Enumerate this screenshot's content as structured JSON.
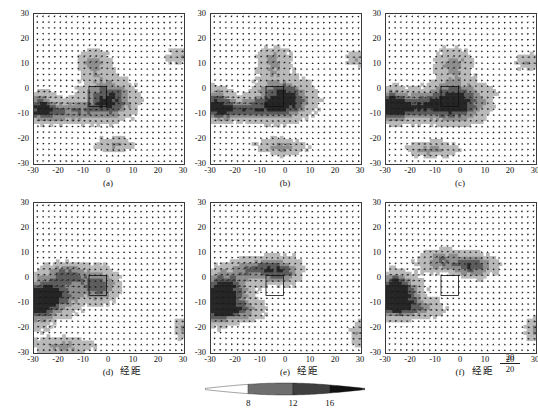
{
  "figure": {
    "width": 538,
    "height": 409,
    "background": "#ffffff",
    "rows": 2,
    "cols": 3
  },
  "axis": {
    "x_label": "经距",
    "y_label": "纬距",
    "x_ticks": [
      "-30",
      "-20",
      "-10",
      "0",
      "10",
      "20",
      "30"
    ],
    "y_ticks": [
      "30",
      "20",
      "10",
      "0",
      "-10",
      "-20",
      "-30"
    ],
    "x_tick_values": [
      -30,
      -20,
      -10,
      0,
      10,
      20,
      30
    ],
    "y_tick_values": [
      30,
      20,
      10,
      0,
      -10,
      -20,
      -30
    ],
    "xlim": [
      -30,
      30
    ],
    "ylim": [
      -30,
      30
    ]
  },
  "panels": [
    {
      "id": "a",
      "label": "(a)",
      "row": 0,
      "col": 0,
      "show_ylabel": true,
      "show_xlabel": false,
      "show_quiverkey": false
    },
    {
      "id": "b",
      "label": "(b)",
      "row": 0,
      "col": 1,
      "show_ylabel": false,
      "show_xlabel": false,
      "show_quiverkey": false
    },
    {
      "id": "c",
      "label": "(c)",
      "row": 0,
      "col": 2,
      "show_ylabel": false,
      "show_xlabel": false,
      "show_quiverkey": false
    },
    {
      "id": "d",
      "label": "(d)",
      "row": 1,
      "col": 0,
      "show_ylabel": true,
      "show_xlabel": true,
      "show_quiverkey": false
    },
    {
      "id": "e",
      "label": "(e)",
      "row": 1,
      "col": 1,
      "show_ylabel": false,
      "show_xlabel": true,
      "show_quiverkey": false
    },
    {
      "id": "f",
      "label": "(f)",
      "row": 1,
      "col": 2,
      "show_ylabel": false,
      "show_xlabel": true,
      "show_quiverkey": true
    }
  ],
  "quiver_key": {
    "value_top": "20",
    "value_bottom": "20",
    "x_position": 20
  },
  "colorbar": {
    "tick_labels": [
      "8",
      "12",
      "16"
    ],
    "tick_values": [
      8,
      12,
      16
    ],
    "shape": "pointed-lens",
    "segments": [
      {
        "from": 0.0,
        "to": 0.27,
        "color": "#ffffff"
      },
      {
        "from": 0.27,
        "to": 0.55,
        "color": "#6e6e6e"
      },
      {
        "from": 0.55,
        "to": 0.78,
        "color": "#3f3f3f"
      },
      {
        "from": 0.78,
        "to": 1.0,
        "color": "#111111"
      }
    ]
  },
  "chart_data": {
    "type": "quiver",
    "title": "",
    "xlabel": "经距",
    "ylabel": "纬距",
    "xlim": [
      -30,
      30
    ],
    "ylim": [
      -30,
      30
    ],
    "grid": false,
    "legend": "colorbar-bottom",
    "colorbar_label": "",
    "colorbar_ticks": [
      8,
      12,
      16
    ],
    "colorbar_range": [
      4,
      20
    ],
    "units_note": "wind speed shading 8/12/16; vector key 20",
    "panel_ids": [
      "a",
      "b",
      "c",
      "d",
      "e",
      "f"
    ],
    "series": [
      {
        "name": "a",
        "shaded_features": [
          {
            "kind": "core",
            "x": 0,
            "y": -4,
            "rx": 9,
            "ry": 7,
            "speed": 17
          },
          {
            "kind": "band",
            "x": -20,
            "y": -9,
            "rx": 13,
            "ry": 4,
            "speed": 14
          },
          {
            "kind": "tail",
            "x": -28,
            "y": -6,
            "rx": 5,
            "ry": 5,
            "speed": 13
          },
          {
            "kind": "plume",
            "x": -6,
            "y": 10,
            "rx": 6,
            "ry": 6,
            "speed": 12
          },
          {
            "kind": "patch",
            "x": 2,
            "y": -22,
            "rx": 7,
            "ry": 3,
            "speed": 11
          },
          {
            "kind": "edge",
            "x": 28,
            "y": 13,
            "rx": 5,
            "ry": 3,
            "speed": 11
          }
        ]
      },
      {
        "name": "b",
        "shaded_features": [
          {
            "kind": "core",
            "x": -1,
            "y": -4,
            "rx": 10,
            "ry": 7,
            "speed": 18
          },
          {
            "kind": "band",
            "x": -20,
            "y": -8,
            "rx": 14,
            "ry": 4,
            "speed": 15
          },
          {
            "kind": "tail",
            "x": -28,
            "y": -5,
            "rx": 5,
            "ry": 6,
            "speed": 13
          },
          {
            "kind": "plume",
            "x": -5,
            "y": 11,
            "rx": 6,
            "ry": 6,
            "speed": 12
          },
          {
            "kind": "patch",
            "x": -2,
            "y": -23,
            "rx": 9,
            "ry": 3,
            "speed": 12
          },
          {
            "kind": "edge",
            "x": 28,
            "y": 12,
            "rx": 4,
            "ry": 3,
            "speed": 11
          }
        ]
      },
      {
        "name": "c",
        "shaded_features": [
          {
            "kind": "core",
            "x": -2,
            "y": -5,
            "rx": 11,
            "ry": 7,
            "speed": 18
          },
          {
            "kind": "band",
            "x": -21,
            "y": -7,
            "rx": 13,
            "ry": 5,
            "speed": 15
          },
          {
            "kind": "tail",
            "x": -28,
            "y": -6,
            "rx": 5,
            "ry": 6,
            "speed": 14
          },
          {
            "kind": "plume",
            "x": -3,
            "y": 10,
            "rx": 7,
            "ry": 6,
            "speed": 12
          },
          {
            "kind": "patch",
            "x": -12,
            "y": -24,
            "rx": 9,
            "ry": 3,
            "speed": 12
          },
          {
            "kind": "edge",
            "x": 27,
            "y": 11,
            "rx": 5,
            "ry": 3,
            "speed": 11
          }
        ]
      },
      {
        "name": "d",
        "shaded_features": [
          {
            "kind": "core",
            "x": -4,
            "y": -3,
            "rx": 7,
            "ry": 6,
            "speed": 15
          },
          {
            "kind": "band",
            "x": -22,
            "y": -7,
            "rx": 9,
            "ry": 7,
            "speed": 16
          },
          {
            "kind": "tail",
            "x": -28,
            "y": -10,
            "rx": 5,
            "ry": 8,
            "speed": 15
          },
          {
            "kind": "plume",
            "x": -16,
            "y": 2,
            "rx": 7,
            "ry": 4,
            "speed": 13
          },
          {
            "kind": "patch",
            "x": -18,
            "y": -27,
            "rx": 11,
            "ry": 3,
            "speed": 12
          },
          {
            "kind": "edge",
            "x": 29,
            "y": -20,
            "rx": 3,
            "ry": 4,
            "speed": 11
          }
        ]
      },
      {
        "name": "e",
        "shaded_features": [
          {
            "kind": "core",
            "x": -2,
            "y": 3,
            "rx": 7,
            "ry": 5,
            "speed": 15
          },
          {
            "kind": "band",
            "x": -23,
            "y": -5,
            "rx": 8,
            "ry": 7,
            "speed": 16
          },
          {
            "kind": "tail",
            "x": -28,
            "y": -9,
            "rx": 5,
            "ry": 8,
            "speed": 15
          },
          {
            "kind": "plume",
            "x": -13,
            "y": 4,
            "rx": 8,
            "ry": 4,
            "speed": 13
          },
          {
            "kind": "patch",
            "x": -20,
            "y": -13,
            "rx": 10,
            "ry": 4,
            "speed": 13
          },
          {
            "kind": "edge",
            "x": 29,
            "y": -22,
            "rx": 3,
            "ry": 5,
            "speed": 11
          }
        ]
      },
      {
        "name": "f",
        "shaded_features": [
          {
            "kind": "core",
            "x": 5,
            "y": 5,
            "rx": 8,
            "ry": 4,
            "speed": 15
          },
          {
            "kind": "band",
            "x": -24,
            "y": -5,
            "rx": 7,
            "ry": 6,
            "speed": 16
          },
          {
            "kind": "tail",
            "x": -28,
            "y": -7,
            "rx": 5,
            "ry": 7,
            "speed": 15
          },
          {
            "kind": "plume",
            "x": -8,
            "y": 7,
            "rx": 8,
            "ry": 4,
            "speed": 13
          },
          {
            "kind": "patch",
            "x": -19,
            "y": -12,
            "rx": 11,
            "ry": 4,
            "speed": 13
          },
          {
            "kind": "edge",
            "x": 29,
            "y": -21,
            "rx": 3,
            "ry": 5,
            "speed": 11
          }
        ]
      }
    ]
  }
}
